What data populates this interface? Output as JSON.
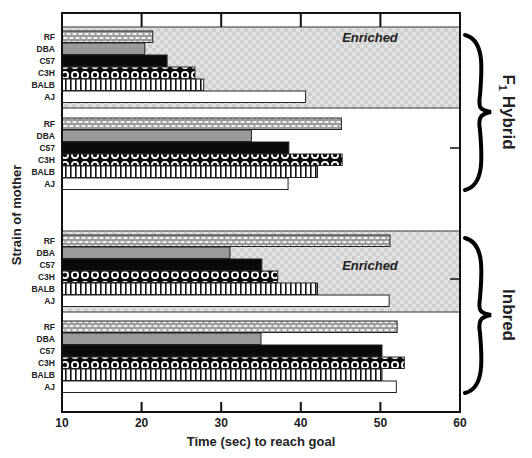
{
  "chart_data": {
    "type": "bar",
    "orientation": "horizontal",
    "title": "",
    "xlabel": "Time (sec) to reach goal",
    "ylabel": "Strain of mother",
    "xlim": [
      10,
      60
    ],
    "xticks": [
      10,
      20,
      30,
      40,
      50,
      60
    ],
    "grid": false,
    "categories": [
      "RF",
      "DBA",
      "C57",
      "C3H",
      "BALB",
      "AJ"
    ],
    "groups": [
      {
        "name": "F1 Hybrid - Enriched",
        "section": "F1 Hybrid",
        "condition": "Enriched",
        "values": {
          "RF": 21.4,
          "DBA": 20.4,
          "C57": 23.2,
          "C3H": 26.7,
          "BALB": 27.8,
          "AJ": 40.6
        }
      },
      {
        "name": "F1 Hybrid - Standard",
        "section": "F1 Hybrid",
        "condition": "Standard",
        "values": {
          "RF": 45.1,
          "DBA": 33.8,
          "C57": 38.5,
          "C3H": 45.2,
          "BALB": 42.1,
          "AJ": 38.4
        }
      },
      {
        "name": "Inbred - Enriched",
        "section": "Inbred",
        "condition": "Enriched",
        "values": {
          "RF": 51.2,
          "DBA": 31.1,
          "C57": 35.1,
          "C3H": 37.1,
          "BALB": 42.1,
          "AJ": 51.1
        }
      },
      {
        "name": "Inbred - Standard",
        "section": "Inbred",
        "condition": "Standard",
        "values": {
          "RF": 52.1,
          "DBA": 35.0,
          "C57": 50.2,
          "C3H": 53.0,
          "BALB": 50.2,
          "AJ": 52.0
        }
      }
    ],
    "annotations": [
      "Enriched",
      "Enriched"
    ],
    "section_labels": [
      "F1 Hybrid",
      "Inbred"
    ],
    "legend": "none (patterns identify strains via row labels)"
  },
  "labels": {
    "xlabel": "Time (sec) to reach goal",
    "ylabel": "Strain of mother",
    "enriched": "Enriched",
    "f1_prefix": "F",
    "f1_sub": "1",
    "f1_suffix": " Hybrid",
    "inbred": "Inbred",
    "xticks": [
      "10",
      "20",
      "30",
      "40",
      "50",
      "60"
    ],
    "strains": [
      "RF",
      "DBA",
      "C57",
      "C3H",
      "BALB",
      "AJ"
    ]
  },
  "colors": {
    "frame": "#111111",
    "enriched_bg": "#d9d9d9",
    "rf": "#bdbdbd",
    "dba": "#9a9a9a",
    "c57": "#0a0a0a",
    "aj": "#ffffff"
  }
}
